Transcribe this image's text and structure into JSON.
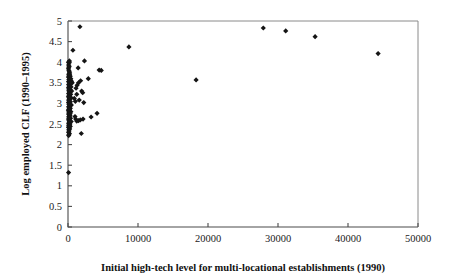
{
  "chart_data": {
    "type": "scatter",
    "title": "",
    "xlabel": "Initial high-tech level for multi-locational establishments (1990)",
    "ylabel": "Log employed CLF (1990–1995)",
    "xlim": [
      0,
      50000
    ],
    "ylim": [
      0,
      5
    ],
    "xticks": [
      0,
      10000,
      20000,
      30000,
      40000,
      50000
    ],
    "xtick_labels": [
      "0",
      "10000",
      "20000",
      "30000",
      "40000",
      "50000"
    ],
    "yticks": [
      0,
      0.5,
      1,
      1.5,
      2,
      2.5,
      3,
      3.5,
      4,
      4.5,
      5
    ],
    "ytick_labels": [
      "0",
      "0.5",
      "1",
      "1.5",
      "2",
      "2.5",
      "3",
      "3.5",
      "4",
      "4.5",
      "5"
    ],
    "grid": false,
    "legend": false,
    "marker": "diamond",
    "marker_color": "#151515",
    "series": [
      {
        "name": "Metropolitan areas",
        "points": [
          [
            1700,
            4.86
          ],
          [
            8700,
            4.37
          ],
          [
            18300,
            3.57
          ],
          [
            27900,
            4.83
          ],
          [
            31100,
            4.76
          ],
          [
            35300,
            4.62
          ],
          [
            44300,
            4.21
          ],
          [
            700,
            4.29
          ],
          [
            200,
            4.03
          ],
          [
            150,
            3.98
          ],
          [
            1450,
            3.86
          ],
          [
            2350,
            4.03
          ],
          [
            4450,
            3.81
          ],
          [
            4750,
            3.8
          ],
          [
            2900,
            3.6
          ],
          [
            1800,
            3.55
          ],
          [
            1500,
            3.5
          ],
          [
            1300,
            3.44
          ],
          [
            1950,
            3.3
          ],
          [
            2100,
            3.26
          ],
          [
            1150,
            3.37
          ],
          [
            1250,
            3.22
          ],
          [
            1600,
            3.08
          ],
          [
            2250,
            3.02
          ],
          [
            1050,
            3.05
          ],
          [
            900,
            3.12
          ],
          [
            3300,
            2.67
          ],
          [
            4150,
            2.76
          ],
          [
            2150,
            2.62
          ],
          [
            1750,
            2.6
          ],
          [
            1500,
            2.58
          ],
          [
            1250,
            2.57
          ],
          [
            1100,
            2.62
          ],
          [
            1000,
            2.68
          ],
          [
            1900,
            2.27
          ],
          [
            80,
            1.32
          ],
          [
            60,
            4.0
          ],
          [
            90,
            3.93
          ],
          [
            110,
            3.88
          ],
          [
            70,
            3.84
          ],
          [
            130,
            3.8
          ],
          [
            180,
            3.77
          ],
          [
            240,
            3.74
          ],
          [
            100,
            3.71
          ],
          [
            150,
            3.68
          ],
          [
            320,
            3.66
          ],
          [
            60,
            3.64
          ],
          [
            210,
            3.62
          ],
          [
            400,
            3.6
          ],
          [
            120,
            3.58
          ],
          [
            280,
            3.56
          ],
          [
            500,
            3.54
          ],
          [
            80,
            3.53
          ],
          [
            170,
            3.51
          ],
          [
            600,
            3.5
          ],
          [
            340,
            3.48
          ],
          [
            90,
            3.46
          ],
          [
            250,
            3.44
          ],
          [
            140,
            3.42
          ],
          [
            430,
            3.4
          ],
          [
            70,
            3.38
          ],
          [
            200,
            3.36
          ],
          [
            310,
            3.34
          ],
          [
            110,
            3.32
          ],
          [
            520,
            3.3
          ],
          [
            160,
            3.28
          ],
          [
            260,
            3.26
          ],
          [
            85,
            3.24
          ],
          [
            380,
            3.22
          ],
          [
            130,
            3.2
          ],
          [
            230,
            3.18
          ],
          [
            65,
            3.16
          ],
          [
            440,
            3.14
          ],
          [
            180,
            3.12
          ],
          [
            290,
            3.1
          ],
          [
            95,
            3.08
          ],
          [
            150,
            3.06
          ],
          [
            350,
            3.04
          ],
          [
            75,
            3.02
          ],
          [
            210,
            3.0
          ],
          [
            120,
            2.98
          ],
          [
            480,
            2.96
          ],
          [
            270,
            2.94
          ],
          [
            90,
            2.92
          ],
          [
            160,
            2.9
          ],
          [
            330,
            2.88
          ],
          [
            105,
            2.86
          ],
          [
            220,
            2.84
          ],
          [
            60,
            2.82
          ],
          [
            410,
            2.8
          ],
          [
            140,
            2.78
          ],
          [
            250,
            2.76
          ],
          [
            80,
            2.74
          ],
          [
            190,
            2.72
          ],
          [
            300,
            2.7
          ],
          [
            115,
            2.68
          ],
          [
            170,
            2.66
          ],
          [
            360,
            2.64
          ],
          [
            70,
            2.62
          ],
          [
            230,
            2.6
          ],
          [
            125,
            2.58
          ],
          [
            460,
            2.56
          ],
          [
            200,
            2.54
          ],
          [
            85,
            2.52
          ],
          [
            280,
            2.5
          ],
          [
            145,
            2.48
          ],
          [
            100,
            2.46
          ],
          [
            320,
            2.44
          ],
          [
            65,
            2.42
          ],
          [
            185,
            2.4
          ],
          [
            240,
            2.38
          ],
          [
            110,
            2.36
          ],
          [
            155,
            2.33
          ],
          [
            75,
            2.3
          ],
          [
            205,
            2.27
          ],
          [
            130,
            2.24
          ],
          [
            95,
            2.22
          ],
          [
            175,
            3.9
          ],
          [
            225,
            3.7
          ],
          [
            145,
            3.35
          ],
          [
            195,
            3.15
          ],
          [
            265,
            2.99
          ],
          [
            135,
            2.85
          ],
          [
            305,
            2.75
          ],
          [
            165,
            2.65
          ],
          [
            215,
            2.55
          ],
          [
            245,
            2.45
          ]
        ]
      }
    ]
  },
  "axes": {
    "y_axis_name": "y-axis",
    "x_axis_name": "x-axis"
  }
}
